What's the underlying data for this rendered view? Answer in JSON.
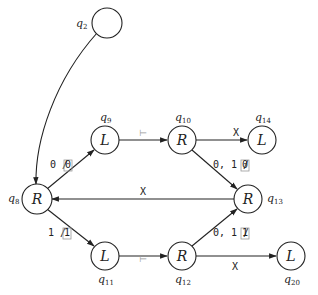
{
  "diagram": {
    "type": "state-machine",
    "nodes": [
      {
        "id": "q2",
        "name": "q",
        "sub": "2",
        "label": "",
        "x": 107,
        "y": 23
      },
      {
        "id": "q8",
        "name": "q",
        "sub": "8",
        "label": "R",
        "x": 37,
        "y": 199
      },
      {
        "id": "q9",
        "name": "q",
        "sub": "9",
        "label": "L",
        "x": 105,
        "y": 140
      },
      {
        "id": "q10",
        "name": "q",
        "sub": "10",
        "label": "R",
        "x": 182,
        "y": 140
      },
      {
        "id": "q14",
        "name": "q",
        "sub": "14",
        "label": "L",
        "x": 262,
        "y": 140
      },
      {
        "id": "q13",
        "name": "q",
        "sub": "13",
        "label": "R",
        "x": 248,
        "y": 199
      },
      {
        "id": "q11",
        "name": "q",
        "sub": "11",
        "label": "L",
        "x": 105,
        "y": 256
      },
      {
        "id": "q12",
        "name": "q",
        "sub": "12",
        "label": "R",
        "x": 182,
        "y": 256
      },
      {
        "id": "q20",
        "name": "q",
        "sub": "20",
        "label": "L",
        "x": 291,
        "y": 256
      }
    ],
    "edges": [
      {
        "from": "q2",
        "to": "q8",
        "label": ""
      },
      {
        "from": "q8",
        "to": "q9",
        "label": "0 / ",
        "boxed": "0"
      },
      {
        "from": "q9",
        "to": "q10",
        "label": "⊢"
      },
      {
        "from": "q10",
        "to": "q14",
        "label": "X"
      },
      {
        "from": "q10",
        "to": "q13",
        "label": "0, 1 / ",
        "boxed": "0"
      },
      {
        "from": "q13",
        "to": "q8",
        "label": "X"
      },
      {
        "from": "q8",
        "to": "q11",
        "label": "1 / ",
        "boxed": "1"
      },
      {
        "from": "q11",
        "to": "q12",
        "label": "⊢"
      },
      {
        "from": "q12",
        "to": "q13",
        "label": "0, 1 / ",
        "boxed": "1"
      },
      {
        "from": "q12",
        "to": "q20",
        "label": "X"
      }
    ]
  }
}
